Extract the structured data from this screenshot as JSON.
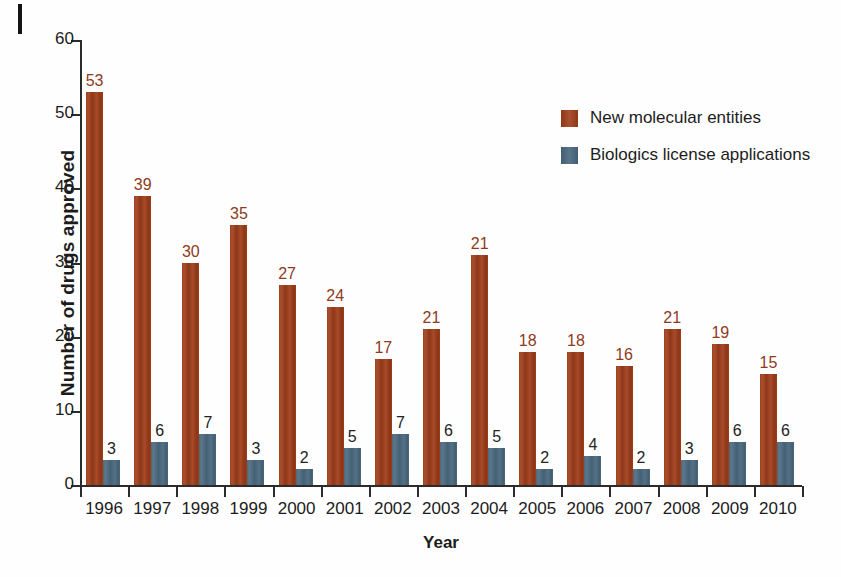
{
  "figure": {
    "marker": "page-edge-mark"
  },
  "chart_data": {
    "type": "bar",
    "title": "",
    "xlabel": "Year",
    "ylabel": "Number of drugs approved",
    "categories": [
      "1996",
      "1997",
      "1998",
      "1999",
      "2000",
      "2001",
      "2002",
      "2003",
      "2004",
      "2005",
      "2006",
      "2007",
      "2008",
      "2009",
      "2010"
    ],
    "series": [
      {
        "name": "New molecular entities",
        "color": "#a03d19",
        "values": [
          53,
          39,
          30,
          35,
          27,
          24,
          17,
          21,
          21,
          18,
          18,
          16,
          21,
          19,
          15
        ],
        "drawn_heights": [
          53,
          39,
          30,
          35,
          27,
          24,
          17,
          21,
          31,
          18,
          18,
          16,
          21,
          19,
          15
        ]
      },
      {
        "name": "Biologics license applications",
        "color": "#4b697f",
        "values": [
          3,
          6,
          7,
          3,
          2,
          5,
          7,
          6,
          5,
          2,
          4,
          2,
          3,
          6,
          6
        ],
        "drawn_heights": [
          3.4,
          5.8,
          6.9,
          3.4,
          2.2,
          5.0,
          6.9,
          5.8,
          5.0,
          2.2,
          3.9,
          2.2,
          3.4,
          5.8,
          5.8
        ]
      }
    ],
    "ylim": [
      0,
      60
    ],
    "yticks": [
      0,
      10,
      20,
      30,
      40,
      50,
      60
    ],
    "ytick_labels": [
      "0",
      "10",
      "20",
      "30",
      "40",
      "50",
      "60"
    ],
    "grid": false,
    "legend_position": "upper-right-inside",
    "show_value_labels": true
  }
}
